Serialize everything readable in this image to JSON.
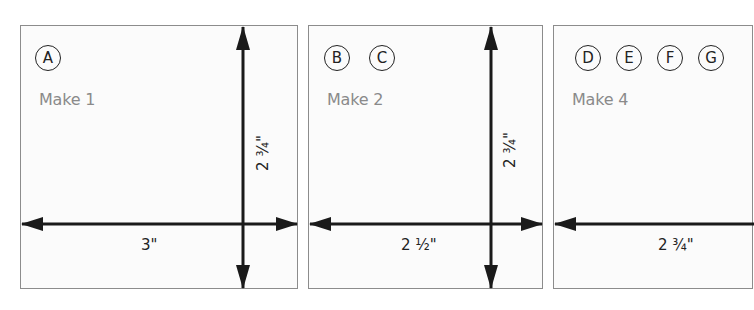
{
  "diagram": {
    "type": "cutting-dimensions",
    "panels": [
      {
        "pieces": [
          "A"
        ],
        "quantity_label": "Make 1",
        "width_label": "3\"",
        "height_label": "2 ¾\""
      },
      {
        "pieces": [
          "B",
          "C"
        ],
        "quantity_label": "Make 2",
        "width_label": "2 ½\"",
        "height_label": "2 ¾\""
      },
      {
        "pieces": [
          "D",
          "E",
          "F",
          "G"
        ],
        "quantity_label": "Make 4",
        "width_label": "2 ¾\""
      }
    ],
    "colors": {
      "border": "#8c8c8c",
      "arrow": "#1a1a1a",
      "label_gray": "#8a8a8a",
      "panel_bg": "#fbfbfb"
    }
  }
}
